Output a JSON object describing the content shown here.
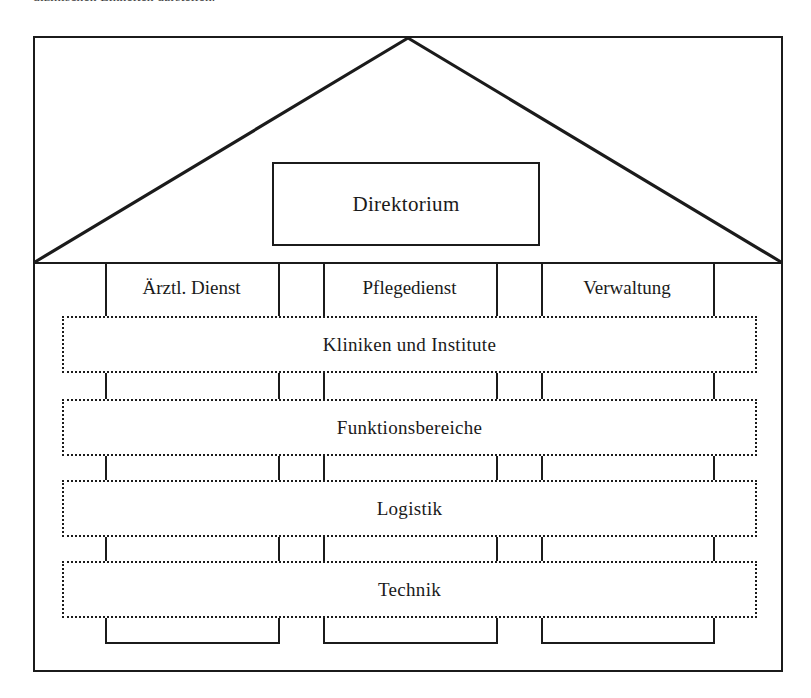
{
  "caption": {
    "text": "dizinischen Einheiten darstellen."
  },
  "diagram": {
    "type": "house-organigram",
    "roof": {
      "label": "Direktorium"
    },
    "columns": [
      {
        "label": "Ärztl. Dienst"
      },
      {
        "label": "Pflegedienst"
      },
      {
        "label": "Verwaltung"
      }
    ],
    "bands": [
      {
        "label": "Kliniken und Institute"
      },
      {
        "label": "Funktionsbereiche"
      },
      {
        "label": "Logistik"
      },
      {
        "label": "Technik"
      }
    ],
    "colors": {
      "line": "#1b1b1b",
      "background": "#ffffff",
      "text": "#1a1a1a"
    }
  }
}
